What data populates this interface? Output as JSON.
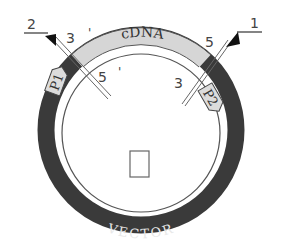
{
  "diagram": {
    "title": "",
    "plasmid": {
      "vector_label": "VECTOR",
      "insert_label": "cDNA",
      "colors": {
        "vector_band": "#3a3a3a",
        "insert_band": "#d6d6d6",
        "outline": "#444444",
        "background": "#ffffff"
      }
    },
    "primers": [
      {
        "id": "P1",
        "label": "P1"
      },
      {
        "id": "P2",
        "label": "P2"
      }
    ],
    "arrows": [
      {
        "id": "arrow-1",
        "label": "1"
      },
      {
        "id": "arrow-2",
        "label": "2"
      }
    ],
    "end_labels": {
      "left_outer": "3",
      "left_outer_prime": "'",
      "left_inner": "5",
      "left_inner_prime": "'",
      "right_outer": "5",
      "right_inner": "3"
    },
    "center_box": {
      "label": ""
    }
  }
}
